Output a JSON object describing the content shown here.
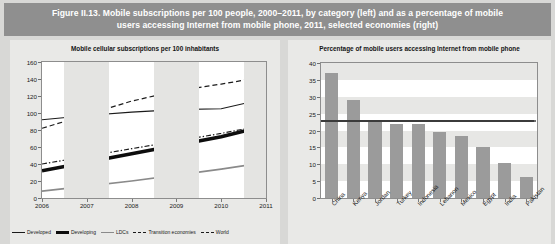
{
  "figure": {
    "caption_line1": "Figure II.13. Mobile subscriptions per 100 people, 2000–2011, by category (left) and as a percentage of mobile",
    "caption_line2": "users accessing Internet from mobile phone, 2011, selected economies (right)",
    "banner_color": "#8f8f8f",
    "panel_bg": "#e9e9e7",
    "plot_bg": "#ffffff",
    "bar_color": "#9b9b9b",
    "refline_color": "#3b3b3b"
  },
  "chart_data": [
    {
      "type": "line",
      "title": "Mobile cellular subscriptions per 100 inhabitants",
      "xlabel": "",
      "ylabel": "",
      "ylim": [
        0,
        160
      ],
      "yticks": [
        0,
        20,
        40,
        60,
        80,
        100,
        120,
        140,
        160
      ],
      "x": [
        2006,
        2007,
        2008,
        2009,
        2010,
        2011
      ],
      "xticklabels": [
        "2006",
        "2007",
        "2008",
        "2009",
        "2010",
        "2011"
      ],
      "grid": false,
      "legend_position": "bottom",
      "series": [
        {
          "name": "Developed",
          "style": "solid-thin",
          "color": "#1a1a1a",
          "values": [
            92,
            97,
            101,
            104,
            105,
            117
          ]
        },
        {
          "name": "Developing",
          "style": "solid-thick",
          "color": "#0d0d0d",
          "values": [
            32,
            42,
            52,
            62,
            72,
            85
          ]
        },
        {
          "name": "LDCs",
          "style": "solid-gray",
          "color": "#8a8a8a",
          "values": [
            8,
            14,
            20,
            27,
            34,
            42
          ]
        },
        {
          "name": "Transition economies",
          "style": "dashed",
          "color": "#1a1a1a",
          "values": [
            82,
            98,
            114,
            126,
            134,
            143
          ]
        },
        {
          "name": "World",
          "style": "dash-dot",
          "color": "#1a1a1a",
          "values": [
            40,
            49,
            58,
            67,
            76,
            86
          ]
        }
      ]
    },
    {
      "type": "bar",
      "title": "Percentage of mobile users accessing Internet from mobile phone",
      "xlabel": "",
      "ylabel": "",
      "ylim": [
        0,
        40
      ],
      "yticks": [
        0,
        5,
        10,
        15,
        20,
        25,
        30,
        35,
        40
      ],
      "categories": [
        "China",
        "Kenya",
        "Jordan",
        "Turkey",
        "Indonesia",
        "Lebanon",
        "Mexico",
        "Egypt",
        "India",
        "Pakistan"
      ],
      "values": [
        37.0,
        29.0,
        23.0,
        22.0,
        22.0,
        19.5,
        18.5,
        15.0,
        10.3,
        6.3
      ],
      "grid": false,
      "annotations": [
        {
          "name": "average-reference-line",
          "type": "hline",
          "value": 23.0
        }
      ]
    }
  ],
  "legend": {
    "items": [
      {
        "label": "Developed"
      },
      {
        "label": "Developing"
      },
      {
        "label": "LDCs"
      },
      {
        "label": "Transition economies"
      },
      {
        "label": "World"
      }
    ]
  }
}
